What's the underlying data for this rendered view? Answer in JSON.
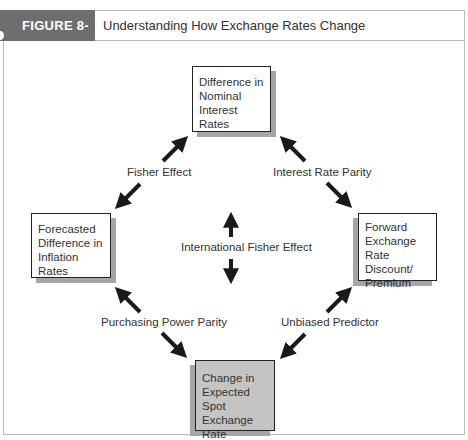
{
  "header": {
    "figure_label": "FIGURE 8-9",
    "title": "Understanding How Exchange Rates Change"
  },
  "boxes": {
    "top": {
      "lines": [
        "Difference in",
        "Nominal",
        "Interest Rates"
      ]
    },
    "left": {
      "lines": [
        "Forecasted",
        "Difference in",
        "Inflation Rates"
      ]
    },
    "right": {
      "lines": [
        "Forward",
        "Exchange Rate",
        "Discount/",
        "Premium"
      ]
    },
    "bottom": {
      "lines": [
        "Change in",
        "Expected Spot",
        "Exchange Rate"
      ]
    }
  },
  "relations": {
    "top_left": "Fisher Effect",
    "top_right": "Interest Rate Parity",
    "center": "International Fisher Effect",
    "bottom_left": "Purchasing Power Parity",
    "bottom_right": "Unbiased Predictor"
  },
  "colors": {
    "label_bg": "#6e6e6e",
    "bottom_box_fill": "#c4c4c4",
    "shadow": "#a6a6a6",
    "arrow": "#1a1a1a"
  }
}
